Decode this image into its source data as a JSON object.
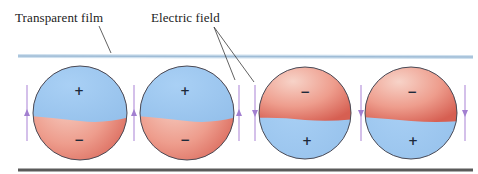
{
  "labels": {
    "transparent_film": "Transparent film",
    "electric_field": "Electric field"
  },
  "colors": {
    "positive_hemisphere": "#9fc8f0",
    "negative_hemisphere_light": "#f4c2b6",
    "negative_hemisphere_dark": "#d9685b",
    "sphere_outline": "#4a4a55",
    "top_film": "#a9c6de",
    "bottom_film": "#555555",
    "field_arrow": "#b08ad6",
    "leader_line": "#333333"
  },
  "spheres": [
    {
      "id": 1,
      "top_sign": "+",
      "bottom_sign": "−",
      "orientation": "positive-up"
    },
    {
      "id": 2,
      "top_sign": "+",
      "bottom_sign": "−",
      "orientation": "positive-up"
    },
    {
      "id": 3,
      "top_sign": "−",
      "bottom_sign": "+",
      "orientation": "negative-up"
    },
    {
      "id": 4,
      "top_sign": "−",
      "bottom_sign": "+",
      "orientation": "negative-up"
    }
  ],
  "field_arrows": [
    {
      "position": "left of sphere 1",
      "direction": "up"
    },
    {
      "position": "between spheres 1 and 2",
      "direction": "up"
    },
    {
      "position": "right of sphere 2",
      "direction": "up"
    },
    {
      "position": "left of sphere 3",
      "direction": "down"
    },
    {
      "position": "between spheres 3 and 4",
      "direction": "down"
    },
    {
      "position": "right of sphere 4",
      "direction": "down"
    }
  ]
}
